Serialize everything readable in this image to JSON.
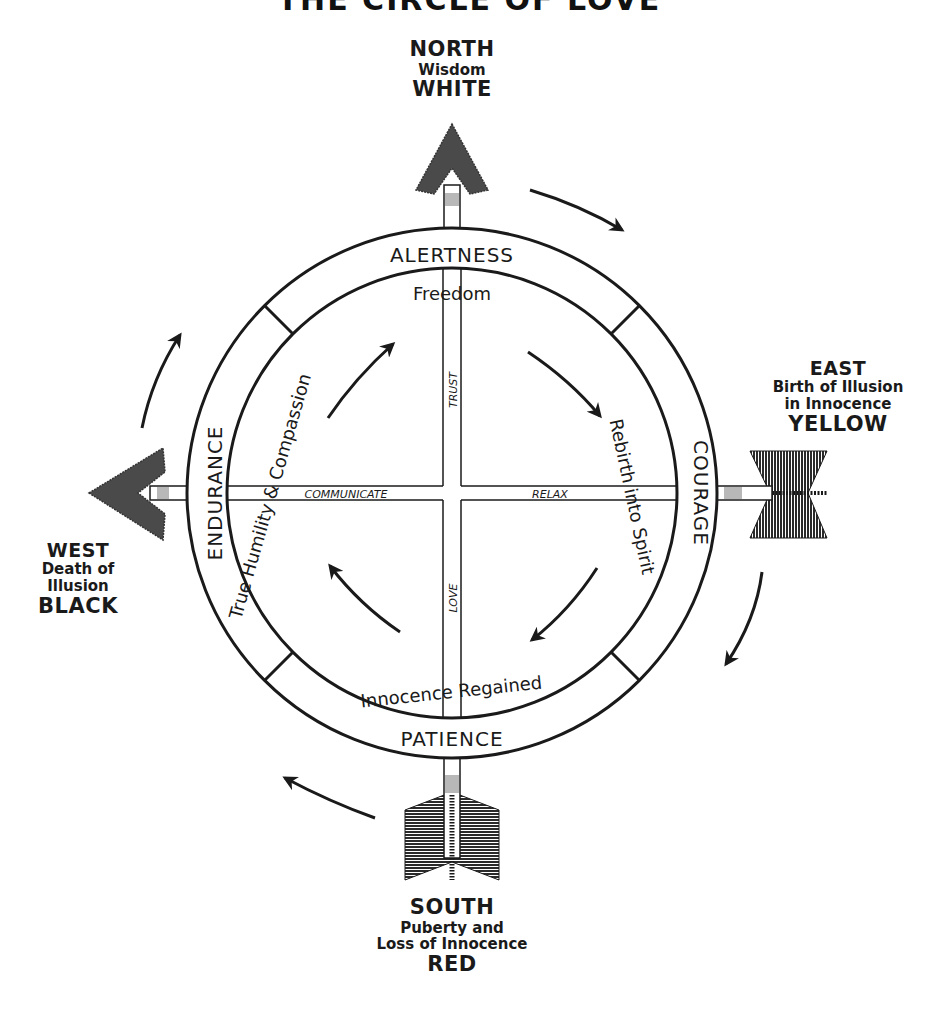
{
  "title": "THE CIRCLE OF LOVE",
  "subtitle": "The Medicine Wheel",
  "directions": {
    "north": {
      "name": "NORTH",
      "meaning": "Wisdom",
      "color_name": "WHITE"
    },
    "east": {
      "name": "EAST",
      "meaning_line1": "Birth of Illusion",
      "meaning_line2": "in Innocence",
      "color_name": "YELLOW"
    },
    "south": {
      "name": "SOUTH",
      "meaning_line1": "Puberty and",
      "meaning_line2": "Loss of Innocence",
      "color_name": "RED"
    },
    "west": {
      "name": "WEST",
      "meaning_line1": "Death of",
      "meaning_line2": "Illusion",
      "color_name": "BLACK"
    }
  },
  "outer_ring": {
    "top": "ALERTNESS",
    "right": "COURAGE",
    "bottom": "PATIENCE",
    "left": "ENDURANCE"
  },
  "inner_ring": {
    "top": "Freedom",
    "right": "Rebirth into Spirit",
    "bottom": "Innocence Regained",
    "left": "True Humility & Compassion"
  },
  "cross": {
    "up": "TRUST",
    "down": "LOVE",
    "left": "COMMUNICATE",
    "right": "RELAX"
  },
  "colors": {
    "ink": "#1a1a1a",
    "arrowhead_fill": "#4a4a4a",
    "shaft_band": "#b8b8b8",
    "background": "#ffffff"
  }
}
